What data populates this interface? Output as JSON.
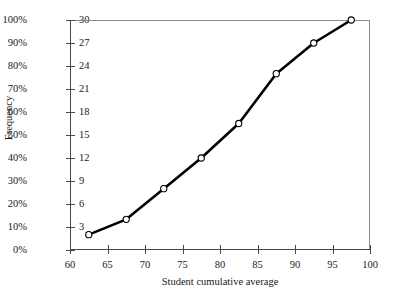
{
  "chart_data": {
    "type": "line",
    "title": "",
    "subtitle": "",
    "xlabel": "Student cumulative average",
    "ylabel": "Frequency",
    "xlim": [
      60,
      100
    ],
    "ylim": [
      0,
      30
    ],
    "grid": false,
    "legend": null,
    "x": [
      62.5,
      67.5,
      72.5,
      77.5,
      82.5,
      87.5,
      92.5,
      97.5
    ],
    "values": [
      2,
      4,
      8,
      12,
      16.5,
      23,
      27,
      30
    ],
    "percent_values": [
      7,
      13,
      27,
      40,
      55,
      76,
      89,
      100
    ],
    "series": [
      {
        "name": "Cumulative frequency",
        "values": [
          2,
          4,
          8,
          12,
          16.5,
          23,
          27,
          30
        ]
      }
    ],
    "xticks": [
      60,
      65,
      70,
      75,
      80,
      85,
      90,
      95,
      100
    ],
    "xticklabels": [
      "60",
      "65",
      "70",
      "75",
      "80",
      "85",
      "90",
      "95",
      "100"
    ],
    "yticks": [
      0,
      3,
      6,
      9,
      12,
      15,
      18,
      21,
      24,
      27,
      30
    ],
    "yticklabels": [
      "0",
      "3",
      "6",
      "9",
      "12",
      "15",
      "18",
      "21",
      "24",
      "27",
      "30"
    ],
    "y2ticks": [
      0,
      10,
      20,
      30,
      40,
      50,
      60,
      70,
      80,
      90,
      100
    ],
    "y2ticklabels": [
      "0%",
      "10%",
      "20%",
      "30%",
      "40%",
      "50%",
      "60%",
      "70%",
      "80%",
      "90%",
      "100%"
    ],
    "line_color": "#000000",
    "marker_face_color": "#ffffff",
    "marker_edge_color": "#000000",
    "axis_color": "#4a4a4a",
    "frame_color": "#8a8a8a",
    "background_color": "#ffffff"
  }
}
